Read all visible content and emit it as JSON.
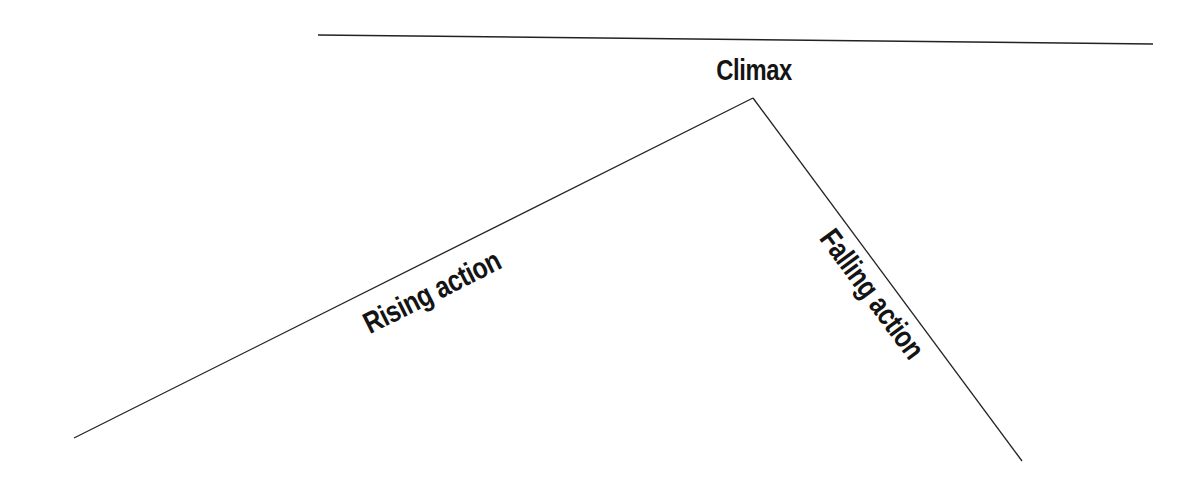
{
  "diagram": {
    "type": "plot-structure",
    "stroke_color": "#222222",
    "top_rule": {
      "x1": 318,
      "y1": 35,
      "x2": 1153,
      "y2": 44
    },
    "rising_line": {
      "x1": 74,
      "y1": 438,
      "x2": 753,
      "y2": 98
    },
    "falling_line": {
      "x1": 753,
      "y1": 98,
      "x2": 1022,
      "y2": 461
    },
    "labels": {
      "climax": "Climax",
      "rising_action": "Rising action",
      "falling_action": "Falling action"
    }
  }
}
